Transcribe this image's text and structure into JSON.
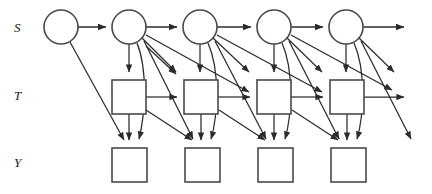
{
  "figure": {
    "type": "directed-graph",
    "width": 432,
    "height": 194,
    "background_color": "#ffffff",
    "line_color": "#2b2b2b",
    "node_stroke_color": "#4a4a4a",
    "node_fill_color": "#ffffff"
  },
  "row_labels": [
    {
      "id": "row-s",
      "text": "S",
      "x": 18,
      "y": 31
    },
    {
      "id": "row-t",
      "text": "T",
      "x": 18,
      "y": 99
    },
    {
      "id": "row-y",
      "text": "Y",
      "x": 18,
      "y": 166
    }
  ],
  "nodes": {
    "s": [
      {
        "id": "s1",
        "shape": "circle",
        "cx": 61,
        "cy": 27,
        "r": 17
      },
      {
        "id": "s2",
        "shape": "circle",
        "cx": 129,
        "cy": 27,
        "r": 17
      },
      {
        "id": "s3",
        "shape": "circle",
        "cx": 200,
        "cy": 27,
        "r": 17
      },
      {
        "id": "s4",
        "shape": "circle",
        "cx": 274,
        "cy": 27,
        "r": 17
      },
      {
        "id": "s5",
        "shape": "circle",
        "cx": 346,
        "cy": 27,
        "r": 17
      }
    ],
    "t": [
      {
        "id": "t1",
        "shape": "square",
        "x": 112,
        "y": 80,
        "w": 34,
        "h": 34
      },
      {
        "id": "t2",
        "shape": "square",
        "x": 184,
        "y": 80,
        "w": 34,
        "h": 34
      },
      {
        "id": "t3",
        "shape": "square",
        "x": 257,
        "y": 80,
        "w": 34,
        "h": 34
      },
      {
        "id": "t4",
        "shape": "square",
        "x": 330,
        "y": 80,
        "w": 34,
        "h": 34
      }
    ],
    "y": [
      {
        "id": "y1",
        "shape": "square",
        "x": 112,
        "y": 148,
        "w": 35,
        "h": 34
      },
      {
        "id": "y2",
        "shape": "square",
        "x": 185,
        "y": 148,
        "w": 35,
        "h": 34
      },
      {
        "id": "y3",
        "shape": "square",
        "x": 258,
        "y": 148,
        "w": 35,
        "h": 34
      },
      {
        "id": "y4",
        "shape": "square",
        "x": 331,
        "y": 148,
        "w": 35,
        "h": 34
      }
    ]
  },
  "edge_counts": {
    "s_to_s": 4,
    "s_outgoing_right": 1,
    "s_to_t": 4,
    "s_to_y": 4,
    "t_to_t": 3,
    "t_to_y": 4,
    "cross_slice_diagonals": 12
  }
}
